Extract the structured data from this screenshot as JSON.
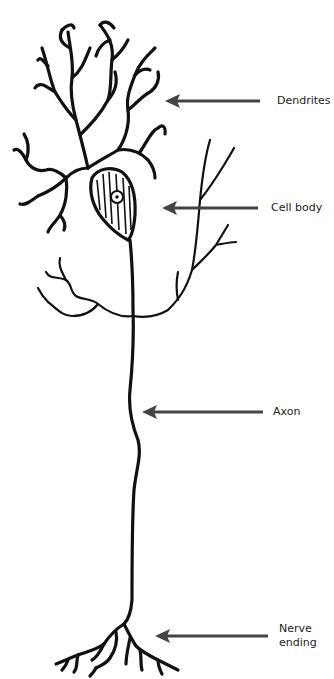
{
  "diagram": {
    "labels": [
      {
        "id": "dendrites",
        "text": "Dendrites",
        "x": 277,
        "y": 96
      },
      {
        "id": "cell_body",
        "text": "Cell body",
        "x": 271,
        "y": 201
      },
      {
        "id": "axon",
        "text": "Axon",
        "x": 273,
        "y": 405
      },
      {
        "id": "nerve_ending_1",
        "text": "Nerve",
        "x": 279,
        "y": 625
      },
      {
        "id": "nerve_ending_2",
        "text": "ending",
        "x": 279,
        "y": 639
      }
    ],
    "colors": {
      "stroke": "#111111",
      "arrow": "#444444",
      "background": "#ffffff"
    }
  }
}
